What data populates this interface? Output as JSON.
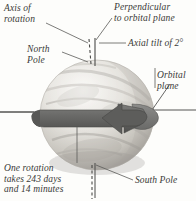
{
  "figure": {
    "background_color": "#fdfdfb",
    "ink_color": "#3a3a38"
  },
  "labels": {
    "axis_of_rotation": "Axis of\nrotation",
    "perpendicular": "Perpendicular\nto orbital plane",
    "axial_tilt": "Axial tilt of 2°",
    "north_pole": "North\nPole",
    "orbital_plane": "Orbital\nplane",
    "rotation_period": "One rotation\ntakes 243 days\nand 14 minutes",
    "south_pole": "South Pole"
  },
  "values": {
    "axial_tilt_degrees": "2°",
    "rotation_days": "243",
    "rotation_minutes": "14"
  },
  "colors": {
    "arrow_band": "#6e6e6e",
    "arrow_band_dark": "#595959",
    "planet_light": "#f2f1ee",
    "planet_mid": "#d9d7d2",
    "planet_shadow": "#a7a5a0",
    "line": "#555553"
  }
}
